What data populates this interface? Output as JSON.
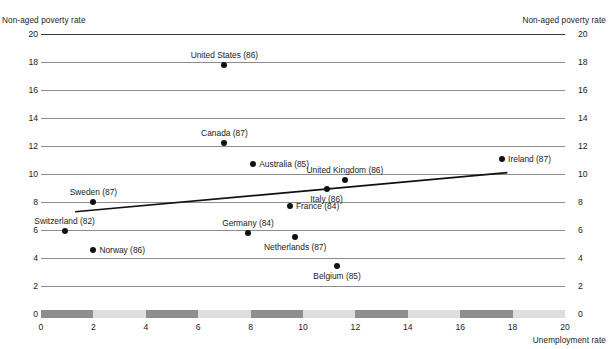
{
  "axis_titles": {
    "y_left": "Non-aged poverty rate",
    "y_right": "Non-aged poverty rate",
    "x": "Unemployment rate"
  },
  "chart_data": {
    "type": "scatter",
    "title": "",
    "xlabel": "Unemployment rate",
    "ylabel": "Non-aged poverty rate",
    "xlim": [
      0,
      20
    ],
    "ylim": [
      0,
      20
    ],
    "xticks": [
      0,
      2,
      4,
      6,
      8,
      10,
      12,
      14,
      16,
      18,
      20
    ],
    "yticks": [
      0,
      2,
      4,
      6,
      8,
      10,
      12,
      14,
      16,
      18,
      20
    ],
    "grid": "horizontal",
    "legend": "none",
    "point_color": "#111111",
    "trendline_color": "#111111",
    "xaxis_band_dark": "#8e8e8e",
    "xaxis_band_light": "#dedede",
    "points": [
      {
        "label": "United States (86)",
        "x": 7.0,
        "y": 17.8,
        "label_pos": "above"
      },
      {
        "label": "Canada (87)",
        "x": 7.0,
        "y": 12.2,
        "label_pos": "above"
      },
      {
        "label": "Australia (85)",
        "x": 8.1,
        "y": 10.7,
        "label_pos": "right"
      },
      {
        "label": "United Kingdom (86)",
        "x": 11.6,
        "y": 9.6,
        "label_pos": "above"
      },
      {
        "label": "Ireland (87)",
        "x": 17.6,
        "y": 11.1,
        "label_pos": "right"
      },
      {
        "label": "Italy (86)",
        "x": 10.9,
        "y": 8.9,
        "label_pos": "below"
      },
      {
        "label": "France (84)",
        "x": 9.5,
        "y": 7.7,
        "label_pos": "right"
      },
      {
        "label": "Sweden (87)",
        "x": 2.0,
        "y": 8.0,
        "label_pos": "above"
      },
      {
        "label": "Switzerland (82)",
        "x": 0.9,
        "y": 5.9,
        "label_pos": "above"
      },
      {
        "label": "Germany (84)",
        "x": 7.9,
        "y": 5.8,
        "label_pos": "above"
      },
      {
        "label": "Netherlands (87)",
        "x": 9.7,
        "y": 5.5,
        "label_pos": "below"
      },
      {
        "label": "Norway (86)",
        "x": 2.0,
        "y": 4.6,
        "label_pos": "right"
      },
      {
        "label": "Belgium (85)",
        "x": 11.3,
        "y": 3.4,
        "label_pos": "below"
      }
    ],
    "trendline": {
      "x1": 1.3,
      "y1": 7.3,
      "x2": 17.8,
      "y2": 10.1
    },
    "xaxis_bands": [
      {
        "from": 0,
        "to": 2,
        "shade": "dark"
      },
      {
        "from": 2,
        "to": 4,
        "shade": "light"
      },
      {
        "from": 4,
        "to": 6,
        "shade": "dark"
      },
      {
        "from": 6,
        "to": 8,
        "shade": "light"
      },
      {
        "from": 8,
        "to": 10,
        "shade": "dark"
      },
      {
        "from": 10,
        "to": 12,
        "shade": "light"
      },
      {
        "from": 12,
        "to": 14,
        "shade": "dark"
      },
      {
        "from": 14,
        "to": 16,
        "shade": "light"
      },
      {
        "from": 16,
        "to": 18,
        "shade": "dark"
      },
      {
        "from": 18,
        "to": 20,
        "shade": "light"
      }
    ]
  }
}
